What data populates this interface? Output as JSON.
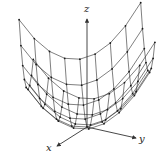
{
  "figure": {
    "type": "wireframe-surface",
    "surface": "paraboloid",
    "equation": "z = x^2 + y^2",
    "colors": {
      "background": "#ffffff",
      "mesh": "#2a2a2a",
      "axes": "#333333",
      "vertex": "#1a1a1a"
    },
    "axes": {
      "x": {
        "label": "x"
      },
      "y": {
        "label": "y"
      },
      "z": {
        "label": "z"
      }
    },
    "mesh": {
      "grid_n": 8,
      "range": 1.0
    }
  }
}
